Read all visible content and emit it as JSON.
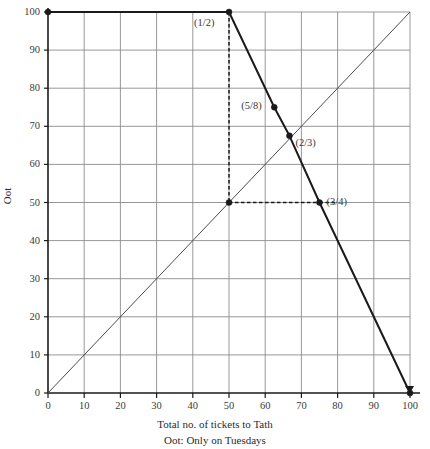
{
  "chart_data": {
    "type": "line",
    "title": "",
    "xlabel": "Total no. of tickets to Tath",
    "ylabel": "Oot",
    "note": "Oot: Only on Tuesdays",
    "xlim": [
      0,
      100
    ],
    "ylim": [
      0,
      100
    ],
    "grid": true,
    "legend": "none",
    "xticks": [
      "0",
      "10",
      "20",
      "30",
      "40",
      "50",
      "60",
      "70",
      "80",
      "90",
      "100"
    ],
    "yticks": [
      "0",
      "10",
      "20",
      "30",
      "40",
      "50",
      "60",
      "70",
      "80",
      "90",
      "100"
    ],
    "xtick_values": [
      0,
      10,
      20,
      30,
      40,
      50,
      60,
      70,
      80,
      90,
      100
    ],
    "ytick_values": [
      0,
      10,
      20,
      30,
      40,
      50,
      60,
      70,
      80,
      90,
      100
    ],
    "series": [
      {
        "name": "best-response-curve",
        "style": "solid-thick-black",
        "x": [
          0,
          50,
          62.5,
          66.7,
          75,
          100
        ],
        "y": [
          100,
          100,
          75,
          67.5,
          50,
          0
        ]
      },
      {
        "name": "forty-five-degree-line",
        "style": "solid-thin-gray",
        "x": [
          0,
          100
        ],
        "y": [
          0,
          100
        ]
      }
    ],
    "guides": [
      {
        "name": "vertical-dashed-at-x-50",
        "orientation": "vertical",
        "x": 50,
        "y_from": 100,
        "y_to": 50
      },
      {
        "name": "horizontal-dashed-at-y-50",
        "orientation": "horizontal",
        "y": 50,
        "x_from": 50,
        "x_to": 75
      },
      {
        "name": "horizontal-dashed-tail-right",
        "orientation": "horizontal",
        "y": 50,
        "x_from": 75,
        "x_to": 80
      }
    ],
    "markers": [
      {
        "name": "origin-top-left",
        "x": 0,
        "y": 100,
        "label": ""
      },
      {
        "name": "half",
        "x": 50,
        "y": 100,
        "label": "(1/2)"
      },
      {
        "name": "five-eighths",
        "x": 62.5,
        "y": 75,
        "label": "(5/8)"
      },
      {
        "name": "two-thirds",
        "x": 66.7,
        "y": 67.5,
        "label": "(2/3)"
      },
      {
        "name": "midpoint-fifty-fifty",
        "x": 50,
        "y": 50,
        "label": ""
      },
      {
        "name": "three-quarters",
        "x": 75,
        "y": 50,
        "label": "(3/4)"
      },
      {
        "name": "end-bottom-right",
        "x": 100,
        "y": 0,
        "label": ""
      }
    ],
    "annotations": [
      {
        "text": "(1/2)",
        "x": 50,
        "y": 100,
        "placement": "left-below"
      },
      {
        "text": "(5/8)",
        "x": 62.5,
        "y": 75,
        "placement": "left"
      },
      {
        "text": "(2/3)",
        "x": 66.7,
        "y": 67.5,
        "placement": "right-below"
      },
      {
        "text": "(3/4)",
        "x": 75,
        "y": 50,
        "placement": "right"
      }
    ],
    "colors": {
      "curve": "#1a1a1a",
      "diagonal": "#4d4d4d",
      "grid": "#8c8c8c",
      "axis": "#1a1a1a",
      "dashed": "#1a1a1a",
      "text": "#2b2b2b",
      "background": "#ffffff"
    }
  }
}
